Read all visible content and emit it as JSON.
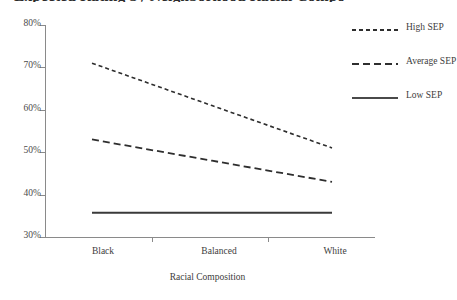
{
  "chart_data": {
    "type": "line",
    "title": "Expected Rating by Neighborhood Racial Composition",
    "xlabel": "Racial Composition",
    "ylabel": "",
    "categories": [
      "Black",
      "Balanced",
      "White"
    ],
    "ytick_labels": [
      "80%",
      "70%",
      "60%",
      "50%",
      "40%",
      "30%"
    ],
    "ytick_values": [
      80,
      70,
      60,
      50,
      40,
      30
    ],
    "ylim": [
      30,
      80
    ],
    "grid": false,
    "legend_position": "right",
    "series": [
      {
        "name": "High SEP",
        "style": "dashed-short",
        "color": "#2e2e2e",
        "values": [
          71.0,
          61.0,
          51.0
        ]
      },
      {
        "name": "Average SEP",
        "style": "dashed-medium",
        "color": "#2e2e2e",
        "values": [
          53.0,
          48.0,
          43.0
        ]
      },
      {
        "name": "Low SEP",
        "style": "solid",
        "color": "#3a3a3a",
        "values": [
          35.7,
          35.7,
          35.7
        ]
      }
    ]
  },
  "legend": {
    "items": [
      {
        "label": "High SEP"
      },
      {
        "label": "Average SEP"
      },
      {
        "label": "Low SEP"
      }
    ]
  }
}
